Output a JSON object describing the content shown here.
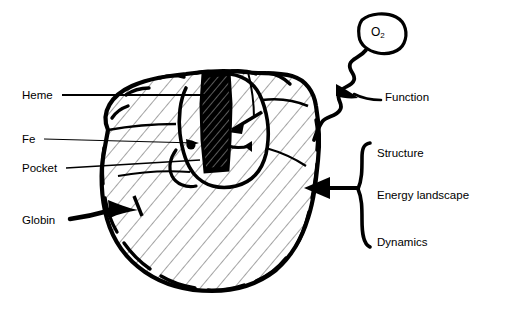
{
  "figure": {
    "type": "schematic-diagram",
    "background_color": "#ffffff",
    "ink_color": "#000000"
  },
  "left_labels": [
    {
      "id": "heme",
      "text": "Heme",
      "x": 22,
      "y": 90,
      "leader": "line"
    },
    {
      "id": "fe",
      "text": "Fe",
      "x": 22,
      "y": 134,
      "leader": "line"
    },
    {
      "id": "pocket",
      "text": "Pocket",
      "x": 22,
      "y": 163,
      "leader": "line"
    },
    {
      "id": "globin",
      "text": "Globin",
      "x": 22,
      "y": 215,
      "leader": "arrow"
    }
  ],
  "molecule": {
    "label": "O",
    "subscript": "2",
    "bubble": {
      "cx": 382,
      "cy": 33,
      "rx": 23,
      "ry": 19
    }
  },
  "function_label": {
    "text": "Function",
    "x": 385,
    "y": 92
  },
  "brace_labels": [
    {
      "id": "structure",
      "text": "Structure",
      "x": 377,
      "y": 148
    },
    {
      "id": "energy-landscape",
      "text": "Energy landscape",
      "x": 377,
      "y": 190
    },
    {
      "id": "dynamics",
      "text": "Dynamics",
      "x": 377,
      "y": 237
    }
  ],
  "brace": {
    "x": 362,
    "top": 143,
    "bottom": 248,
    "cusp": 190
  },
  "arrow_into_protein": {
    "from_x": 360,
    "to_x": 305,
    "y": 188
  }
}
